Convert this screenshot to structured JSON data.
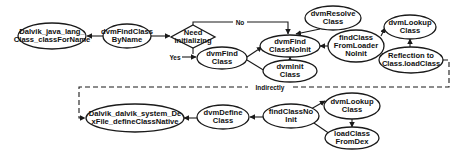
{
  "diagram": {
    "type": "call-flow",
    "nodes": {
      "class_for_name": {
        "lines": [
          "Dalvik_java_lang_",
          "Class_classForName"
        ],
        "shape": "ellipse"
      },
      "find_class_by_name": {
        "lines": [
          "dvmFindClass",
          "ByName"
        ],
        "shape": "ellipse"
      },
      "need_init": {
        "lines": [
          "Need",
          "initializing"
        ],
        "shape": "diamond"
      },
      "find_class": {
        "lines": [
          "dvmFind",
          "Class"
        ],
        "shape": "ellipse"
      },
      "find_class_no_init": {
        "lines": [
          "dvmFind",
          "ClassNoInit"
        ],
        "shape": "ellipse"
      },
      "resolve_class": {
        "lines": [
          "dvmResolve",
          "Class"
        ],
        "shape": "ellipse"
      },
      "init_class": {
        "lines": [
          "dvmInit",
          "Class"
        ],
        "shape": "ellipse"
      },
      "find_class_from_loader": {
        "lines": [
          "findClass",
          "FromLoader",
          "NoInit"
        ],
        "shape": "ellipse"
      },
      "lookup_class_top": {
        "lines": [
          "dvmLookup",
          "Class"
        ],
        "shape": "ellipse"
      },
      "reflection": {
        "lines": [
          "Reflection to",
          "Class.loadClass"
        ],
        "shape": "ellipse"
      },
      "define_class_native": {
        "lines": [
          "Dalvik_dalvik_system_De",
          "xFile_defineClassNative"
        ],
        "shape": "ellipse"
      },
      "define_class": {
        "lines": [
          "dvmDefine",
          "Class"
        ],
        "shape": "ellipse"
      },
      "find_class_no_init_2": {
        "lines": [
          "findClassNo",
          "Init"
        ],
        "shape": "ellipse"
      },
      "lookup_class_bottom": {
        "lines": [
          "dvmLookup",
          "Class"
        ],
        "shape": "ellipse"
      },
      "load_class_from_dex": {
        "lines": [
          "loadClass",
          "FromDex"
        ],
        "shape": "ellipse"
      }
    },
    "edges": [
      {
        "from": "class_for_name",
        "to": "find_class_by_name",
        "label": ""
      },
      {
        "from": "find_class_by_name",
        "to": "need_init",
        "label": ""
      },
      {
        "from": "need_init",
        "to": "find_class_no_init",
        "label": "No"
      },
      {
        "from": "need_init",
        "to": "find_class",
        "label": "Yes"
      },
      {
        "from": "find_class",
        "to": "find_class_no_init",
        "label": ""
      },
      {
        "from": "find_class",
        "to": "init_class",
        "label": ""
      },
      {
        "from": "resolve_class",
        "to": "find_class_no_init",
        "label": ""
      },
      {
        "from": "init_class",
        "to": "find_class_no_init",
        "label": ""
      },
      {
        "from": "find_class_from_loader",
        "to": "find_class_no_init",
        "label": ""
      },
      {
        "from": "find_class_from_loader",
        "to": "lookup_class_top",
        "label": ""
      },
      {
        "from": "find_class_from_loader",
        "to": "reflection",
        "label": ""
      },
      {
        "from": "reflection",
        "to": "lookup_class_top",
        "label": ""
      },
      {
        "from": "reflection",
        "to": "define_class_native",
        "label": "Indirectly",
        "style": "dashed"
      },
      {
        "from": "define_class",
        "to": "define_class_native",
        "label": ""
      },
      {
        "from": "find_class_no_init_2",
        "to": "define_class",
        "label": ""
      },
      {
        "from": "find_class_no_init_2",
        "to": "lookup_class_bottom",
        "label": ""
      },
      {
        "from": "find_class_no_init_2",
        "to": "load_class_from_dex",
        "label": ""
      },
      {
        "from": "lookup_class_bottom",
        "to": "load_class_from_dex",
        "label": ""
      }
    ],
    "edge_labels": {
      "no": "No",
      "yes": "Yes",
      "indirectly": "Indirectly"
    }
  }
}
